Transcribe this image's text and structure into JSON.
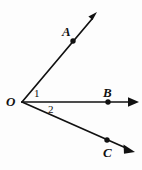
{
  "figure": {
    "background_color": "#fdfdfd",
    "stroke_color": "#111111",
    "vertex": {
      "name": "O",
      "label": "O",
      "x": 22,
      "y": 102
    },
    "rays": [
      {
        "id": "ray-OA",
        "endpoint_label": "A",
        "point_label": "A",
        "from": {
          "x": 22,
          "y": 102
        },
        "to": {
          "x": 97,
          "y": 13
        },
        "marked_point": {
          "x": 73,
          "y": 41
        },
        "has_arrowhead": true
      },
      {
        "id": "ray-OB",
        "endpoint_label": "B",
        "point_label": "B",
        "from": {
          "x": 22,
          "y": 102
        },
        "to": {
          "x": 138,
          "y": 102
        },
        "marked_point": {
          "x": 108,
          "y": 102
        },
        "has_arrowhead": true
      },
      {
        "id": "ray-OC",
        "endpoint_label": "C",
        "point_label": "C",
        "from": {
          "x": 22,
          "y": 102
        },
        "to": {
          "x": 134,
          "y": 152
        },
        "marked_point": {
          "x": 107,
          "y": 140
        },
        "has_arrowhead": true
      }
    ],
    "angles": [
      {
        "id": "angle-1",
        "label": "1",
        "between": "OA and OB",
        "label_x": 37,
        "label_y": 93
      },
      {
        "id": "angle-2",
        "label": "2",
        "between": "OB and OC",
        "label_x": 51,
        "label_y": 109
      }
    ]
  }
}
